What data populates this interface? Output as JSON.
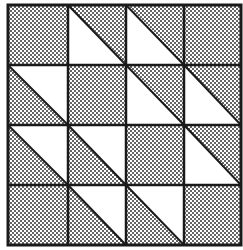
{
  "diagram": {
    "type": "quilt-block",
    "grid": {
      "rows": 4,
      "cols": 4
    },
    "colors": {
      "background": "#ffffff",
      "line": "#1a1a1a",
      "dot": "#222222",
      "light": "#ffffff"
    },
    "legend_note": "D = fully dotted square; TR = triangle square, diagonal top-left to bottom-right, dotted upper-right half, white lower-left half; BL = triangle square, diagonal top-left to bottom-right, dotted lower-left half, white upper-right half",
    "cells": [
      [
        "D",
        "TR",
        "TR",
        "D"
      ],
      [
        "BL",
        "D",
        "TR",
        "TR"
      ],
      [
        "BL",
        "BL",
        "D",
        "TR"
      ],
      [
        "D",
        "BL",
        "BL",
        "D"
      ]
    ]
  }
}
